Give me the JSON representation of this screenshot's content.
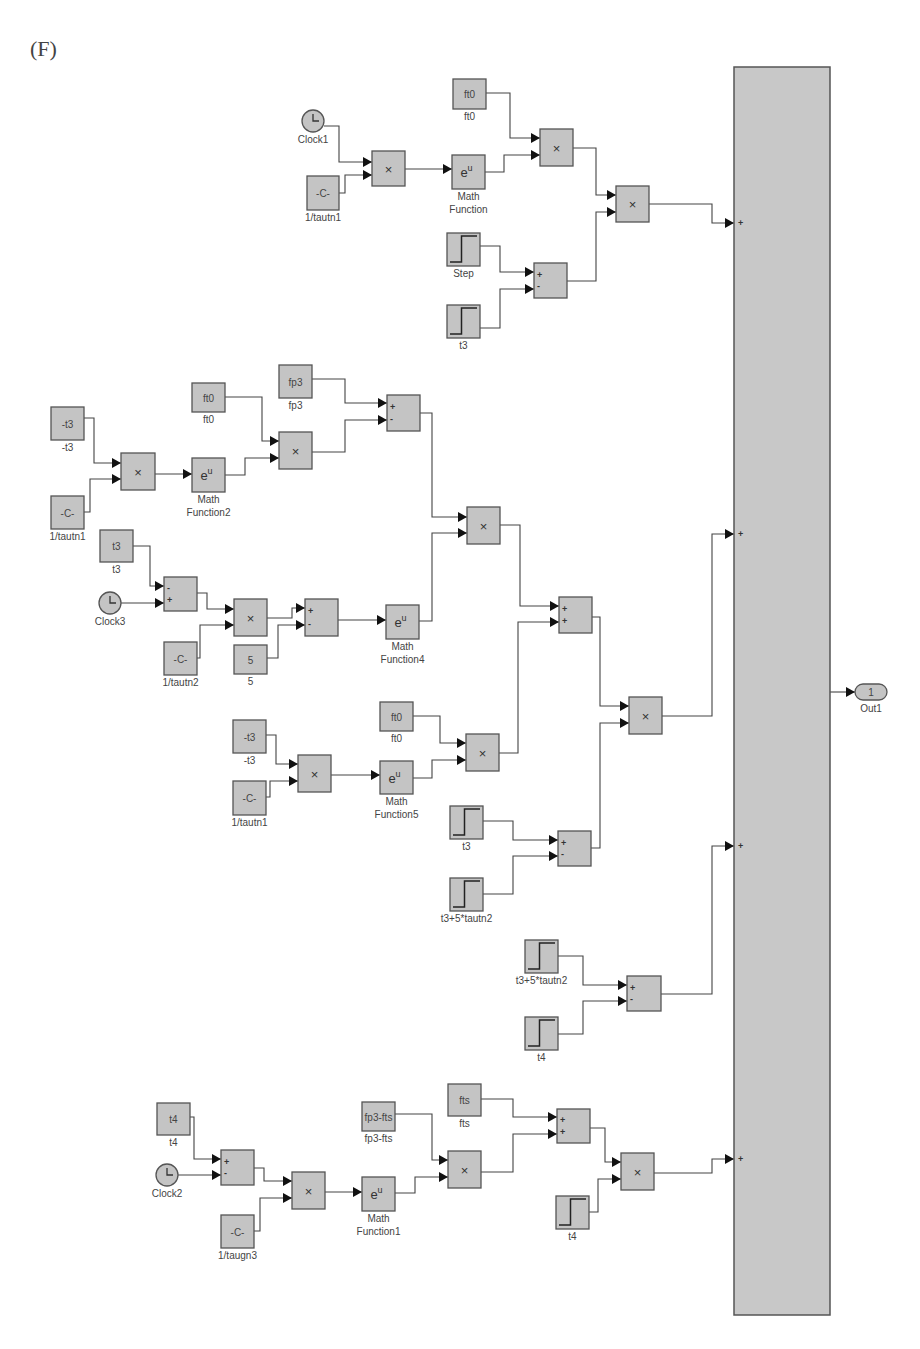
{
  "figure_label": "(F)",
  "colors": {
    "block_fill": "#c4c4c4",
    "block_stroke": "#555555",
    "wire": "#444444",
    "background": "#ffffff"
  },
  "bus": {
    "name": "Sum (4 inputs)",
    "x": 734,
    "y": 67,
    "w": 96,
    "h": 1248,
    "input_signs": [
      "+",
      "+",
      "+",
      "+",
      "+"
    ],
    "input_ys": [
      223,
      534,
      846,
      1159
    ]
  },
  "outport": {
    "label": "Out1",
    "number": "1",
    "x": 855,
    "y": 684,
    "w": 32,
    "h": 16
  },
  "blocks": [
    {
      "id": "clock1",
      "type": "clock",
      "x": 313,
      "y": 121,
      "r": 11,
      "label": "Clock1"
    },
    {
      "id": "c1",
      "type": "box",
      "x": 307,
      "y": 176,
      "w": 32,
      "h": 34,
      "text": "-C-",
      "label": "1/tautn1"
    },
    {
      "id": "m1",
      "type": "box",
      "x": 372,
      "y": 151,
      "w": 33,
      "h": 35,
      "text": "×",
      "label": ""
    },
    {
      "id": "e1",
      "type": "box",
      "x": 452,
      "y": 155,
      "w": 33,
      "h": 34,
      "text": "eᵘ",
      "label": "Math Function"
    },
    {
      "id": "ft0a",
      "type": "box",
      "x": 453,
      "y": 79,
      "w": 33,
      "h": 30,
      "text": "ft0",
      "label": "ft0"
    },
    {
      "id": "m2",
      "type": "box",
      "x": 540,
      "y": 129,
      "w": 33,
      "h": 37,
      "text": "×",
      "label": ""
    },
    {
      "id": "m3",
      "type": "box",
      "x": 616,
      "y": 186,
      "w": 33,
      "h": 36,
      "text": "×",
      "label": ""
    },
    {
      "id": "step1",
      "type": "step",
      "x": 447,
      "y": 233,
      "w": 33,
      "h": 33,
      "label": "Step"
    },
    {
      "id": "t3a",
      "type": "step",
      "x": 447,
      "y": 305,
      "w": 33,
      "h": 33,
      "label": "t3"
    },
    {
      "id": "s1",
      "type": "sum",
      "x": 534,
      "y": 263,
      "w": 33,
      "h": 35,
      "signs": [
        "+",
        "-"
      ],
      "label": ""
    },
    {
      "id": "nt3a",
      "type": "box",
      "x": 51,
      "y": 407,
      "w": 33,
      "h": 33,
      "text": "-t3",
      "label": "-t3"
    },
    {
      "id": "c2",
      "type": "box",
      "x": 51,
      "y": 496,
      "w": 33,
      "h": 33,
      "text": "-C-",
      "label": "1/tautn1"
    },
    {
      "id": "m4",
      "type": "box",
      "x": 121,
      "y": 453,
      "w": 34,
      "h": 37,
      "text": "×",
      "label": ""
    },
    {
      "id": "e2",
      "type": "box",
      "x": 192,
      "y": 458,
      "w": 33,
      "h": 34,
      "text": "eᵘ",
      "label": "Math Function2"
    },
    {
      "id": "ft0b",
      "type": "box",
      "x": 192,
      "y": 383,
      "w": 33,
      "h": 29,
      "text": "ft0",
      "label": "ft0"
    },
    {
      "id": "fp3",
      "type": "box",
      "x": 279,
      "y": 365,
      "w": 33,
      "h": 33,
      "text": "fp3",
      "label": "fp3"
    },
    {
      "id": "m5",
      "type": "box",
      "x": 279,
      "y": 432,
      "w": 33,
      "h": 37,
      "text": "×",
      "label": ""
    },
    {
      "id": "s2",
      "type": "sum",
      "x": 387,
      "y": 395,
      "w": 33,
      "h": 36,
      "signs": [
        "+",
        "-"
      ],
      "label": ""
    },
    {
      "id": "t3b",
      "type": "box",
      "x": 100,
      "y": 530,
      "w": 33,
      "h": 32,
      "text": "t3",
      "label": "t3"
    },
    {
      "id": "clock3",
      "type": "clock",
      "x": 110,
      "y": 603,
      "r": 11,
      "label": "Clock3"
    },
    {
      "id": "s3",
      "type": "sum",
      "x": 164,
      "y": 577,
      "w": 33,
      "h": 34,
      "signs": [
        "-",
        "+"
      ],
      "label": ""
    },
    {
      "id": "c3",
      "type": "box",
      "x": 164,
      "y": 642,
      "w": 33,
      "h": 33,
      "text": "-C-",
      "label": "1/tautn2"
    },
    {
      "id": "m6",
      "type": "box",
      "x": 234,
      "y": 599,
      "w": 33,
      "h": 37,
      "text": "×",
      "label": ""
    },
    {
      "id": "five",
      "type": "box",
      "x": 234,
      "y": 645,
      "w": 33,
      "h": 29,
      "text": "5",
      "label": "5"
    },
    {
      "id": "s4",
      "type": "sum",
      "x": 305,
      "y": 599,
      "w": 33,
      "h": 37,
      "signs": [
        "+",
        "-"
      ],
      "label": ""
    },
    {
      "id": "e4",
      "type": "box",
      "x": 386,
      "y": 605,
      "w": 33,
      "h": 34,
      "text": "eᵘ",
      "label": "Math Function4"
    },
    {
      "id": "m7",
      "type": "box",
      "x": 467,
      "y": 507,
      "w": 33,
      "h": 37,
      "text": "×",
      "label": ""
    },
    {
      "id": "s5",
      "type": "sum",
      "x": 559,
      "y": 597,
      "w": 33,
      "h": 36,
      "signs": [
        "+",
        "+"
      ],
      "label": ""
    },
    {
      "id": "m8",
      "type": "box",
      "x": 629,
      "y": 697,
      "w": 33,
      "h": 37,
      "text": "×",
      "label": ""
    },
    {
      "id": "nt3b",
      "type": "box",
      "x": 233,
      "y": 720,
      "w": 33,
      "h": 33,
      "text": "-t3",
      "label": "-t3"
    },
    {
      "id": "c4",
      "type": "box",
      "x": 233,
      "y": 781,
      "w": 33,
      "h": 34,
      "text": "-C-",
      "label": "1/tautn1"
    },
    {
      "id": "m9",
      "type": "box",
      "x": 298,
      "y": 755,
      "w": 33,
      "h": 37,
      "text": "×",
      "label": ""
    },
    {
      "id": "e5",
      "type": "box",
      "x": 380,
      "y": 761,
      "w": 33,
      "h": 33,
      "text": "eᵘ",
      "label": "Math Function5"
    },
    {
      "id": "ft0c",
      "type": "box",
      "x": 380,
      "y": 702,
      "w": 33,
      "h": 29,
      "text": "ft0",
      "label": "ft0"
    },
    {
      "id": "m10",
      "type": "box",
      "x": 466,
      "y": 734,
      "w": 33,
      "h": 37,
      "text": "×",
      "label": ""
    },
    {
      "id": "t3c",
      "type": "step",
      "x": 450,
      "y": 806,
      "w": 33,
      "h": 33,
      "label": "t3"
    },
    {
      "id": "t3p5a",
      "type": "step",
      "x": 450,
      "y": 878,
      "w": 33,
      "h": 33,
      "label": "t3+5*tautn2"
    },
    {
      "id": "s6",
      "type": "sum",
      "x": 558,
      "y": 831,
      "w": 33,
      "h": 35,
      "signs": [
        "+",
        "-"
      ],
      "label": ""
    },
    {
      "id": "t3p5b",
      "type": "step",
      "x": 525,
      "y": 940,
      "w": 33,
      "h": 33,
      "label": "t3+5*tautn2"
    },
    {
      "id": "t4a",
      "type": "step",
      "x": 525,
      "y": 1017,
      "w": 33,
      "h": 33,
      "label": "t4"
    },
    {
      "id": "s7",
      "type": "sum",
      "x": 627,
      "y": 976,
      "w": 34,
      "h": 35,
      "signs": [
        "+",
        "-"
      ],
      "label": ""
    },
    {
      "id": "t4b",
      "type": "box",
      "x": 157,
      "y": 1103,
      "w": 33,
      "h": 32,
      "text": "t4",
      "label": "t4"
    },
    {
      "id": "clock2",
      "type": "clock",
      "x": 167,
      "y": 1175,
      "r": 11,
      "label": "Clock2"
    },
    {
      "id": "s8",
      "type": "sum",
      "x": 221,
      "y": 1150,
      "w": 33,
      "h": 35,
      "signs": [
        "+",
        "-"
      ],
      "label": ""
    },
    {
      "id": "c5",
      "type": "box",
      "x": 221,
      "y": 1215,
      "w": 33,
      "h": 33,
      "text": "-C-",
      "label": "1/taugn3"
    },
    {
      "id": "m11",
      "type": "box",
      "x": 292,
      "y": 1172,
      "w": 33,
      "h": 37,
      "text": "×",
      "label": ""
    },
    {
      "id": "e1b",
      "type": "box",
      "x": 362,
      "y": 1177,
      "w": 33,
      "h": 34,
      "text": "eᵘ",
      "label": "Math Function1"
    },
    {
      "id": "fp3fts",
      "type": "box",
      "x": 362,
      "y": 1102,
      "w": 33,
      "h": 29,
      "text": "fp3-fts",
      "label": "fp3-fts"
    },
    {
      "id": "fts",
      "type": "box",
      "x": 448,
      "y": 1084,
      "w": 33,
      "h": 32,
      "text": "fts",
      "label": "fts"
    },
    {
      "id": "m12",
      "type": "box",
      "x": 448,
      "y": 1151,
      "w": 33,
      "h": 37,
      "text": "×",
      "label": ""
    },
    {
      "id": "s9",
      "type": "sum",
      "x": 557,
      "y": 1109,
      "w": 33,
      "h": 34,
      "signs": [
        "+",
        "+"
      ],
      "label": ""
    },
    {
      "id": "t4c",
      "type": "step",
      "x": 556,
      "y": 1196,
      "w": 33,
      "h": 33,
      "label": "t4"
    },
    {
      "id": "m13",
      "type": "box",
      "x": 621,
      "y": 1153,
      "w": 33,
      "h": 37,
      "text": "×",
      "label": ""
    }
  ],
  "wires": [
    [
      [
        324,
        126
      ],
      [
        339,
        126
      ],
      [
        339,
        162
      ],
      [
        372,
        162
      ]
    ],
    [
      [
        339,
        193
      ],
      [
        345,
        193
      ],
      [
        345,
        175
      ],
      [
        372,
        175
      ]
    ],
    [
      [
        405,
        169
      ],
      [
        452,
        169
      ]
    ],
    [
      [
        486,
        93
      ],
      [
        510,
        93
      ],
      [
        510,
        138
      ],
      [
        540,
        138
      ]
    ],
    [
      [
        485,
        172
      ],
      [
        504,
        172
      ],
      [
        504,
        155
      ],
      [
        540,
        155
      ]
    ],
    [
      [
        573,
        148
      ],
      [
        596,
        148
      ],
      [
        596,
        195
      ],
      [
        616,
        195
      ]
    ],
    [
      [
        567,
        281
      ],
      [
        596,
        281
      ],
      [
        596,
        212
      ],
      [
        616,
        212
      ]
    ],
    [
      [
        480,
        246
      ],
      [
        500,
        246
      ],
      [
        500,
        272
      ],
      [
        534,
        272
      ]
    ],
    [
      [
        480,
        328
      ],
      [
        500,
        328
      ],
      [
        500,
        289
      ],
      [
        534,
        289
      ]
    ],
    [
      [
        649,
        204
      ],
      [
        712,
        204
      ],
      [
        712,
        223
      ],
      [
        734,
        223
      ]
    ],
    [
      [
        84,
        418
      ],
      [
        94,
        418
      ],
      [
        94,
        463
      ],
      [
        121,
        463
      ]
    ],
    [
      [
        84,
        512
      ],
      [
        90,
        512
      ],
      [
        90,
        479
      ],
      [
        121,
        479
      ]
    ],
    [
      [
        155,
        474
      ],
      [
        192,
        474
      ]
    ],
    [
      [
        225,
        397
      ],
      [
        262,
        397
      ],
      [
        262,
        441
      ],
      [
        279,
        441
      ]
    ],
    [
      [
        225,
        475
      ],
      [
        245,
        475
      ],
      [
        245,
        458
      ],
      [
        279,
        458
      ]
    ],
    [
      [
        312,
        379
      ],
      [
        345,
        379
      ],
      [
        345,
        403
      ],
      [
        387,
        403
      ]
    ],
    [
      [
        312,
        452
      ],
      [
        345,
        452
      ],
      [
        345,
        420
      ],
      [
        387,
        420
      ]
    ],
    [
      [
        420,
        413
      ],
      [
        432,
        413
      ],
      [
        432,
        517
      ],
      [
        467,
        517
      ]
    ],
    [
      [
        133,
        546
      ],
      [
        150,
        546
      ],
      [
        150,
        586
      ],
      [
        164,
        586
      ]
    ],
    [
      [
        121,
        603
      ],
      [
        164,
        603
      ]
    ],
    [
      [
        197,
        593
      ],
      [
        207,
        593
      ],
      [
        207,
        609
      ],
      [
        234,
        609
      ]
    ],
    [
      [
        197,
        658
      ],
      [
        200,
        658
      ],
      [
        200,
        625
      ],
      [
        234,
        625
      ]
    ],
    [
      [
        267,
        618
      ],
      [
        292,
        618
      ],
      [
        292,
        608
      ],
      [
        305,
        608
      ]
    ],
    [
      [
        267,
        658
      ],
      [
        278,
        658
      ],
      [
        278,
        625
      ],
      [
        305,
        625
      ]
    ],
    [
      [
        338,
        620
      ],
      [
        386,
        620
      ]
    ],
    [
      [
        419,
        621
      ],
      [
        432,
        621
      ],
      [
        432,
        533
      ],
      [
        467,
        533
      ]
    ],
    [
      [
        500,
        525
      ],
      [
        520,
        525
      ],
      [
        520,
        606
      ],
      [
        559,
        606
      ]
    ],
    [
      [
        499,
        753
      ],
      [
        518,
        753
      ],
      [
        518,
        622
      ],
      [
        559,
        622
      ]
    ],
    [
      [
        592,
        617
      ],
      [
        600,
        617
      ],
      [
        600,
        706
      ],
      [
        629,
        706
      ]
    ],
    [
      [
        591,
        848
      ],
      [
        600,
        848
      ],
      [
        600,
        723
      ],
      [
        629,
        723
      ]
    ],
    [
      [
        662,
        716
      ],
      [
        712,
        716
      ],
      [
        712,
        534
      ],
      [
        734,
        534
      ]
    ],
    [
      [
        266,
        735
      ],
      [
        276,
        735
      ],
      [
        276,
        764
      ],
      [
        298,
        764
      ]
    ],
    [
      [
        266,
        797
      ],
      [
        270,
        797
      ],
      [
        270,
        781
      ],
      [
        298,
        781
      ]
    ],
    [
      [
        331,
        775
      ],
      [
        380,
        775
      ]
    ],
    [
      [
        413,
        716
      ],
      [
        440,
        716
      ],
      [
        440,
        743
      ],
      [
        466,
        743
      ]
    ],
    [
      [
        413,
        778
      ],
      [
        432,
        778
      ],
      [
        432,
        760
      ],
      [
        466,
        760
      ]
    ],
    [
      [
        483,
        821
      ],
      [
        513,
        821
      ],
      [
        513,
        840
      ],
      [
        558,
        840
      ]
    ],
    [
      [
        483,
        894
      ],
      [
        513,
        894
      ],
      [
        513,
        856
      ],
      [
        558,
        856
      ]
    ],
    [
      [
        558,
        956
      ],
      [
        583,
        956
      ],
      [
        583,
        985
      ],
      [
        627,
        985
      ]
    ],
    [
      [
        558,
        1034
      ],
      [
        583,
        1034
      ],
      [
        583,
        1001
      ],
      [
        627,
        1001
      ]
    ],
    [
      [
        661,
        994
      ],
      [
        712,
        994
      ],
      [
        712,
        846
      ],
      [
        734,
        846
      ]
    ],
    [
      [
        190,
        1117
      ],
      [
        194,
        1117
      ],
      [
        194,
        1159
      ],
      [
        221,
        1159
      ]
    ],
    [
      [
        178,
        1175
      ],
      [
        221,
        1175
      ]
    ],
    [
      [
        254,
        1168
      ],
      [
        264,
        1168
      ],
      [
        264,
        1181
      ],
      [
        292,
        1181
      ]
    ],
    [
      [
        254,
        1231
      ],
      [
        260,
        1231
      ],
      [
        260,
        1198
      ],
      [
        292,
        1198
      ]
    ],
    [
      [
        325,
        1192
      ],
      [
        362,
        1192
      ]
    ],
    [
      [
        395,
        1114
      ],
      [
        432,
        1114
      ],
      [
        432,
        1160
      ],
      [
        448,
        1160
      ]
    ],
    [
      [
        395,
        1193
      ],
      [
        415,
        1193
      ],
      [
        415,
        1177
      ],
      [
        448,
        1177
      ]
    ],
    [
      [
        481,
        1099
      ],
      [
        513,
        1099
      ],
      [
        513,
        1117
      ],
      [
        557,
        1117
      ]
    ],
    [
      [
        481,
        1172
      ],
      [
        513,
        1172
      ],
      [
        513,
        1134
      ],
      [
        557,
        1134
      ]
    ],
    [
      [
        590,
        1128
      ],
      [
        605,
        1128
      ],
      [
        605,
        1162
      ],
      [
        621,
        1162
      ]
    ],
    [
      [
        589,
        1212
      ],
      [
        598,
        1212
      ],
      [
        598,
        1179
      ],
      [
        621,
        1179
      ]
    ],
    [
      [
        654,
        1173
      ],
      [
        712,
        1173
      ],
      [
        712,
        1159
      ],
      [
        734,
        1159
      ]
    ],
    [
      [
        830,
        692
      ],
      [
        855,
        692
      ]
    ]
  ]
}
